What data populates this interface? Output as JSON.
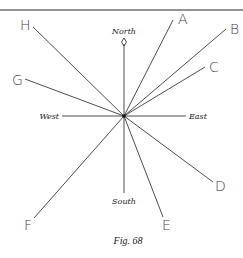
{
  "figure": {
    "caption": "Fig. 68",
    "center": {
      "x": 124,
      "y": 116
    },
    "directions": {
      "north": "North",
      "south": "South",
      "east": "East",
      "west": "West"
    },
    "rays": [
      {
        "label": "A",
        "end": [
          173,
          20
        ],
        "label_pos": [
          178,
          24
        ]
      },
      {
        "label": "B",
        "end": [
          226,
          29
        ],
        "label_pos": [
          230,
          34
        ]
      },
      {
        "label": "C",
        "end": [
          205,
          67
        ],
        "label_pos": [
          209,
          72
        ]
      },
      {
        "label": "D",
        "end": [
          213,
          182
        ],
        "label_pos": [
          215,
          191
        ]
      },
      {
        "label": "E",
        "end": [
          163,
          217
        ],
        "label_pos": [
          162,
          230
        ]
      },
      {
        "label": "F",
        "end": [
          34,
          218
        ],
        "label_pos": [
          24,
          230
        ]
      },
      {
        "label": "G",
        "end": [
          25,
          79
        ],
        "label_pos": [
          12,
          85
        ]
      },
      {
        "label": "H",
        "end": [
          33,
          27
        ],
        "label_pos": [
          20,
          30
        ]
      }
    ]
  }
}
